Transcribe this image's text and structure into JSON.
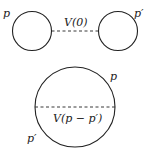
{
  "diagram": {
    "top": {
      "left_label": "p",
      "right_label": "p′",
      "line_label": "V(0)"
    },
    "bottom": {
      "top_label": "p",
      "bottom_label": "p′",
      "line_label": "V(p − p′)"
    },
    "colors": {
      "stroke": "#222222",
      "background": "#ffffff"
    }
  }
}
